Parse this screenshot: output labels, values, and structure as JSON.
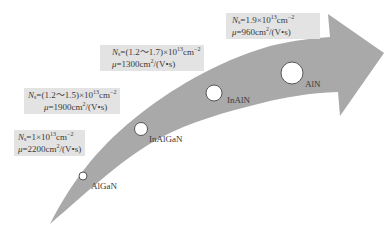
{
  "diagram": {
    "type": "evolution-arrow",
    "arrow_color": "#a9a9a9",
    "box_color": "#e3e3e3",
    "circle_fill": "#ffffff",
    "circle_stroke": "#555555",
    "stages": [
      {
        "material": "AlGaN",
        "ns_symbol": "N",
        "ns_sub": "s",
        "ns_value_prefix": "=1×10",
        "ns_exp": "13",
        "ns_unit": "cm",
        "ns_unit_exp": "−2",
        "mu_symbol": "μ",
        "mu_value": "=2200cm",
        "mu_unit_exp": "2",
        "mu_unit_tail": "/(V•s)",
        "ns_text": "Ns=1×10^13cm^-2",
        "mu_text": "μ=2200cm2/(V•s)"
      },
      {
        "material": "InAlGaN",
        "ns_symbol": "N",
        "ns_sub": "s",
        "ns_value_prefix": "=(1.2～1.5)×10",
        "ns_exp": "13",
        "ns_unit": "cm",
        "ns_unit_exp": "−2",
        "mu_symbol": "μ",
        "mu_value": "=1900cm",
        "mu_unit_exp": "2",
        "mu_unit_tail": "/(V•s)",
        "ns_text": "Ns=(1.2~1.5)×10^13cm^-2",
        "mu_text": "μ=1900cm2/(V•s)"
      },
      {
        "material": "InAlN",
        "ns_symbol": "N",
        "ns_sub": "s",
        "ns_value_prefix": "=(1.2～1.7)×10",
        "ns_exp": "13",
        "ns_unit": "cm",
        "ns_unit_exp": "−2",
        "mu_symbol": "μ",
        "mu_value": "=1300cm",
        "mu_unit_exp": "2",
        "mu_unit_tail": "/(V•s)",
        "ns_text": "Ns=(1.2~1.7)×10^13cm^-2",
        "mu_text": "μ=1300cm2/(V•s)"
      },
      {
        "material": "AlN",
        "ns_symbol": "N",
        "ns_sub": "s",
        "ns_value_prefix": "=1.9×10",
        "ns_exp": "13",
        "ns_unit": "cm",
        "ns_unit_exp": "−2",
        "mu_symbol": "μ",
        "mu_value": "=960cm",
        "mu_unit_exp": "2",
        "mu_unit_tail": "/(V•s)",
        "ns_text": "Ns=1.9×10^13cm^-2",
        "mu_text": "μ=960cm2/(V•s)"
      }
    ]
  }
}
